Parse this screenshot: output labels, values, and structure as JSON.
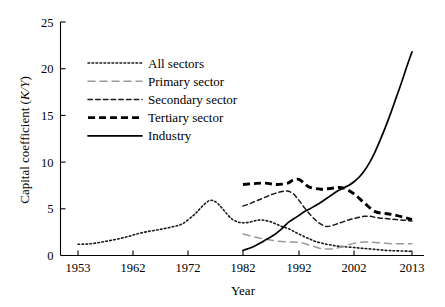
{
  "chart_data": {
    "type": "line",
    "title": "",
    "subtitle": "",
    "xlabel": "Year",
    "ylabel": "Capital coefficient (K/Y)",
    "ylabel_plain": "Capital coefficient (",
    "ylabel_italic": "K/Y",
    "ylabel_close": ")",
    "xlim": [
      1953,
      2013
    ],
    "ylim": [
      0,
      25
    ],
    "yticks": [
      0,
      5,
      10,
      15,
      20,
      25
    ],
    "ytick_labels": [
      "0",
      "5",
      "10",
      "15",
      "20",
      "25"
    ],
    "xticks": [
      1953,
      1962,
      1972,
      1982,
      1992,
      2002,
      2013
    ],
    "xtick_labels": [
      "1953",
      "1962",
      "1972",
      "1982",
      "1992",
      "2002",
      "2013"
    ],
    "grid": false,
    "legend_position": "upper-left",
    "series": [
      {
        "name": "All sectors",
        "style": "dotted",
        "color": "#1a1a1a",
        "width": 1.6,
        "dash": "1.6,2.4",
        "x": [
          1953,
          1955,
          1957,
          1959,
          1961,
          1963,
          1965,
          1967,
          1969,
          1971,
          1973,
          1974,
          1975,
          1976,
          1977,
          1978,
          1979,
          1980,
          1981,
          1982,
          1983,
          1984,
          1985,
          1986,
          1987,
          1988,
          1989,
          1990,
          1991,
          1992,
          1993,
          1994,
          1995,
          1996,
          1997,
          1998,
          1999,
          2000,
          2002,
          2004,
          2006,
          2008,
          2010,
          2013
        ],
        "y": [
          1.2,
          1.25,
          1.45,
          1.7,
          2.0,
          2.35,
          2.6,
          2.8,
          3.05,
          3.4,
          4.3,
          4.9,
          5.5,
          5.9,
          5.75,
          5.2,
          4.5,
          3.9,
          3.6,
          3.5,
          3.55,
          3.7,
          3.8,
          3.75,
          3.6,
          3.35,
          3.1,
          2.9,
          2.6,
          2.3,
          2.0,
          1.75,
          1.5,
          1.35,
          1.2,
          1.1,
          1.0,
          0.95,
          0.85,
          0.75,
          0.65,
          0.55,
          0.5,
          0.45
        ]
      },
      {
        "name": "Primary sector",
        "style": "long-dash",
        "color": "#9a9a9a",
        "width": 1.5,
        "dash": "7,5",
        "x": [
          1982,
          1984,
          1986,
          1988,
          1990,
          1992,
          1994,
          1996,
          1998,
          2000,
          2002,
          2004,
          2006,
          2008,
          2010,
          2013
        ],
        "y": [
          2.3,
          2.0,
          1.75,
          1.55,
          1.45,
          1.4,
          1.1,
          0.75,
          0.7,
          0.95,
          1.3,
          1.45,
          1.4,
          1.3,
          1.25,
          1.25
        ]
      },
      {
        "name": "Secondary sector",
        "style": "dashed",
        "color": "#1a1a1a",
        "width": 1.5,
        "dash": "4.5,3.2",
        "x": [
          1982,
          1983,
          1984,
          1985,
          1986,
          1987,
          1988,
          1989,
          1990,
          1991,
          1992,
          1993,
          1994,
          1995,
          1996,
          1997,
          1998,
          1999,
          2000,
          2001,
          2002,
          2003,
          2004,
          2005,
          2006,
          2007,
          2008,
          2010,
          2013
        ],
        "y": [
          5.3,
          5.5,
          5.75,
          6.0,
          6.25,
          6.5,
          6.7,
          6.85,
          6.9,
          6.6,
          5.9,
          5.1,
          4.4,
          3.8,
          3.35,
          3.1,
          3.2,
          3.4,
          3.6,
          3.8,
          3.95,
          4.1,
          4.2,
          4.2,
          4.1,
          4.0,
          3.95,
          3.85,
          3.7
        ]
      },
      {
        "name": "Tertiary sector",
        "style": "bold-dash",
        "color": "#000000",
        "width": 2.9,
        "dash": "7,4",
        "x": [
          1982,
          1984,
          1986,
          1988,
          1990,
          1991,
          1992,
          1993,
          1994,
          1996,
          1998,
          2000,
          2002,
          2004,
          2006,
          2008,
          2010,
          2013
        ],
        "y": [
          7.6,
          7.7,
          7.75,
          7.6,
          7.75,
          8.1,
          8.15,
          7.7,
          7.3,
          7.1,
          7.2,
          7.25,
          6.6,
          5.6,
          4.7,
          4.5,
          4.3,
          3.85
        ]
      },
      {
        "name": "Industry",
        "style": "solid",
        "color": "#000000",
        "width": 1.7,
        "dash": "",
        "x": [
          1982,
          1983,
          1984,
          1985,
          1986,
          1987,
          1988,
          1989,
          1990,
          1991,
          1992,
          1993,
          1994,
          1995,
          1996,
          1997,
          1998,
          1999,
          2000,
          2001,
          2002,
          2003,
          2004,
          2005,
          2006,
          2007,
          2008,
          2009,
          2010,
          2011,
          2012,
          2013
        ],
        "y": [
          0.55,
          0.75,
          1.0,
          1.3,
          1.65,
          2.0,
          2.4,
          2.9,
          3.5,
          3.9,
          4.3,
          4.7,
          5.0,
          5.35,
          5.7,
          6.1,
          6.5,
          6.9,
          7.2,
          7.5,
          7.9,
          8.4,
          9.1,
          10.0,
          11.1,
          12.4,
          13.8,
          15.3,
          16.9,
          18.5,
          20.2,
          21.8
        ]
      }
    ]
  },
  "legend": {
    "items": [
      {
        "label": "All sectors"
      },
      {
        "label": "Primary sector"
      },
      {
        "label": "Secondary sector"
      },
      {
        "label": "Tertiary sector"
      },
      {
        "label": "Industry"
      }
    ]
  }
}
